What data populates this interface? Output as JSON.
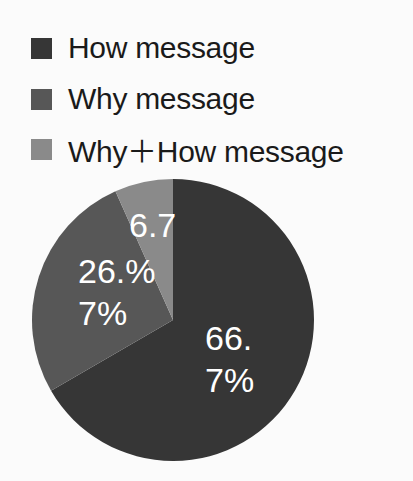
{
  "chart_data": {
    "type": "pie",
    "title": "",
    "categories": [
      "How message",
      "Why message",
      "Why+How message"
    ],
    "values": [
      66.7,
      26.7,
      6.7
    ],
    "colors": [
      "#363636",
      "#575757",
      "#8a8a8a"
    ],
    "legend_position": "top-left",
    "data_labels": [
      {
        "line1": "66.",
        "line2": "7%"
      },
      {
        "line1": "26.%",
        "line2": "7%"
      },
      {
        "line1": "6.7",
        "line2": ""
      }
    ]
  },
  "legend": {
    "items": [
      {
        "label": "How message",
        "color": "#363636"
      },
      {
        "label": "Why message",
        "color": "#575757"
      },
      {
        "label": "Why＋How message",
        "color": "#8a8a8a"
      }
    ]
  }
}
